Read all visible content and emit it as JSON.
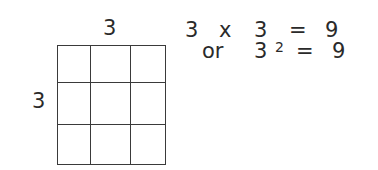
{
  "diagram": {
    "top_label": "3",
    "side_label": "3",
    "grid": {
      "rows": 3,
      "cols": 3,
      "line_color": "#3a3a3a"
    },
    "equation_1": {
      "left": "3",
      "op": "x",
      "right": "3",
      "equals": "=",
      "result": "9"
    },
    "equation_2": {
      "prefix": "or",
      "base": "3",
      "exponent": "2",
      "equals": "=",
      "result": "9"
    }
  }
}
